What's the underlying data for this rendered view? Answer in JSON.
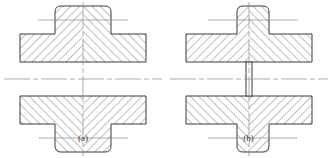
{
  "figure": {
    "background_color": "#ffffff",
    "outline_color": "#3b3b3b",
    "hatch_color": "#4a4a4a",
    "centerline_color": "#8a8a8a",
    "subfigures": [
      {
        "id": "a",
        "caption": "(a)",
        "title": "cross-section of pipe fitting with solid central boss",
        "description": "Sectioned cross-shaped pipe joint; horizontal pipe bore open through the centre, vertical bosses above and below shown solid with chevron hatching.",
        "center_bore": "open through",
        "vertical_boss_width": "wide",
        "hatch_pattern": "chevron, mirrored about the vertical centre line"
      },
      {
        "id": "b",
        "caption": "(b)",
        "title": "cross-section of pipe fitting with thin central rib",
        "description": "Sectioned cross-shaped pipe joint; a thin unhatched vertical rib wall crosses the horizontal bore on the centre line, vertical bosses above and below are narrower than in (a).",
        "center_bore": "blocked by thin vertical rib",
        "vertical_boss_width": "narrow",
        "hatch_pattern": "chevron, mirrored about the vertical centre line"
      }
    ]
  }
}
